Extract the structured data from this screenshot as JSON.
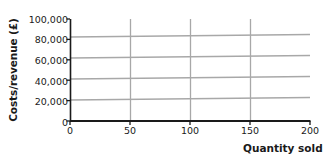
{
  "chart_data": {
    "type": "line",
    "title": "",
    "xlabel": "Quantity sold",
    "ylabel": "Costs/revenue (£)",
    "xlim": [
      0,
      200
    ],
    "ylim": [
      0,
      100000
    ],
    "xticks": [
      "0",
      "50",
      "100",
      "150",
      "200"
    ],
    "xtick_values": [
      0,
      50,
      100,
      150,
      200
    ],
    "yticks": [
      "0",
      "20,000",
      "40,000",
      "60,000",
      "80,000",
      "100,000"
    ],
    "ytick_values": [
      0,
      20000,
      40000,
      60000,
      80000,
      100000
    ],
    "grid": "vertical gridlines at 50, 100, 150",
    "legend": "none",
    "series": [
      {
        "name": "line-1",
        "x": [
          0,
          200
        ],
        "values": [
          20600,
          23100
        ]
      },
      {
        "name": "line-2",
        "x": [
          0,
          200
        ],
        "values": [
          41200,
          43700
        ]
      },
      {
        "name": "line-3",
        "x": [
          0,
          200
        ],
        "values": [
          61800,
          64300
        ]
      },
      {
        "name": "line-4",
        "x": [
          0,
          200
        ],
        "values": [
          82400,
          84900
        ]
      }
    ],
    "series_color": "#a8a8a8",
    "axis_color": "#1a1a1a",
    "gridline_color": "#a8a8a8"
  },
  "axis": {
    "y_title": "Costs/revenue (£)",
    "x_title": "Quantity sold",
    "y_labels": [
      "100,000",
      "80,000",
      "60,000",
      "40,000",
      "20,000",
      "0"
    ],
    "x_labels": [
      "0",
      "50",
      "100",
      "150",
      "200"
    ]
  }
}
